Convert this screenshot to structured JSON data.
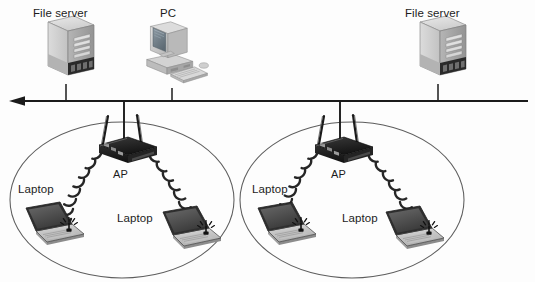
{
  "diagram": {
    "type": "wireless-network-topology",
    "backbone": {
      "name": "ethernet-bus-backbone",
      "direction_arrow": "left",
      "y": 101,
      "x_start": 10,
      "x_end": 528
    },
    "top_nodes": [
      {
        "id": "file-server-left",
        "label": "File server",
        "icon": "server-tower-icon",
        "x": 66,
        "label_x": 33,
        "label_y": 8
      },
      {
        "id": "pc",
        "label": "PC",
        "icon": "desktop-computer-icon",
        "x": 172,
        "label_x": 160,
        "label_y": 8
      },
      {
        "id": "file-server-right",
        "label": "File server",
        "icon": "server-tower-icon",
        "x": 438,
        "label_x": 405,
        "label_y": 8
      }
    ],
    "cells": [
      {
        "id": "wireless-cell-left",
        "ellipse": {
          "cx": 122,
          "cy": 200,
          "rx": 112,
          "ry": 78
        },
        "ap": {
          "label": "AP",
          "icon": "access-point-icon",
          "x": 124,
          "y": 146,
          "label_x": 113,
          "label_y": 169
        },
        "laptops": [
          {
            "label": "Laptop",
            "icon": "laptop-icon",
            "x": 50,
            "y": 228,
            "label_x": 18,
            "label_y": 184,
            "signal": "wifi-signal-icon"
          },
          {
            "label": "Laptop",
            "icon": "laptop-icon",
            "x": 187,
            "y": 232,
            "label_x": 117,
            "label_y": 213,
            "signal": "wifi-signal-icon"
          }
        ]
      },
      {
        "id": "wireless-cell-right",
        "ellipse": {
          "cx": 352,
          "cy": 200,
          "rx": 112,
          "ry": 78
        },
        "ap": {
          "label": "AP",
          "icon": "access-point-icon",
          "x": 340,
          "y": 146,
          "label_x": 331,
          "label_y": 169
        },
        "laptops": [
          {
            "label": "Laptop",
            "icon": "laptop-icon",
            "x": 282,
            "y": 228,
            "label_x": 252,
            "label_y": 184,
            "signal": "wifi-signal-icon"
          },
          {
            "label": "Laptop",
            "icon": "laptop-icon",
            "x": 410,
            "y": 232,
            "label_x": 342,
            "label_y": 213,
            "signal": "wifi-signal-icon"
          }
        ]
      }
    ],
    "colors": {
      "line": "#1b1b1b",
      "ellipse": "#5d5d5d",
      "server_light": "#d8d8d8",
      "server_mid": "#b9b9b9",
      "server_dark": "#8f8f8f",
      "ap_dark": "#1f1f1f",
      "laptop_screen": "#4a4a4a",
      "laptop_base": "#cfcfcf",
      "arc": "#2b2b2b",
      "text": "#1c1c1c"
    }
  }
}
